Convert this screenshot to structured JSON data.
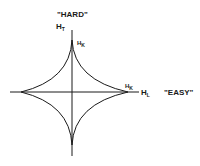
{
  "labels": {
    "hard": "\"HARD\"",
    "easy": "\"EASY\"",
    "ht_main": "H",
    "ht_sub": "T",
    "hl_main": "H",
    "hl_sub": "L",
    "hk_top": "H",
    "hk_top_sub": "K",
    "hk_right": "H",
    "hk_right_sub": "K"
  },
  "diagram": {
    "type": "astroid",
    "axes": {
      "vertical": "H_T (hard axis)",
      "horizontal": "H_L (easy axis)"
    },
    "cusps": [
      "top: H_K",
      "right: H_K",
      "bottom",
      "left"
    ],
    "stroke_color": "#1a1a1a"
  }
}
